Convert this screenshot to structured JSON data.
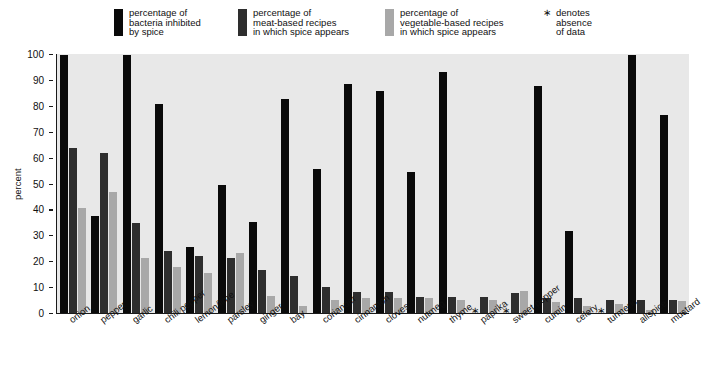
{
  "legend": {
    "items": [
      {
        "label": "percentage of\nbacteria inhibited\nby spice",
        "color": "#0a0a0a",
        "name": "legend-bacteria"
      },
      {
        "label": "percentage of\nmeat-based recipes\nin which spice appears",
        "color": "#2e2e2e",
        "name": "legend-meat"
      },
      {
        "label": "percentage of\nvegetable-based recipes\nin which spice appears",
        "color": "#a8a8a8",
        "name": "legend-vegetable"
      }
    ],
    "note": {
      "symbol": "∗",
      "text": "denotes\nabsence\nof data"
    }
  },
  "chart_data": {
    "type": "bar",
    "title": "",
    "xlabel": "",
    "ylabel": "percent",
    "ylim": [
      0,
      100
    ],
    "yticks": [
      0,
      10,
      20,
      30,
      40,
      50,
      60,
      70,
      80,
      90,
      100
    ],
    "grid": false,
    "legend_position": "top",
    "categories": [
      "onion",
      "pepper",
      "garlic",
      "chili pepper",
      "lemon/lime",
      "parsley",
      "ginger",
      "bay",
      "coriander",
      "cinnamon",
      "cloves",
      "nutmeg",
      "thyme",
      "paprika",
      "sweet pepper",
      "cumin",
      "celery",
      "turmeric",
      "allspice",
      "mustard"
    ],
    "series": [
      {
        "name": "percentage of bacteria inhibited by spice",
        "color": "#0a0a0a",
        "values": [
          100,
          38,
          100,
          81,
          26,
          50,
          35.5,
          83,
          56,
          89,
          86,
          55,
          93.5,
          null,
          null,
          88,
          32,
          null,
          100,
          77
        ]
      },
      {
        "name": "percentage of meat-based recipes in which spice appears",
        "color": "#2e2e2e",
        "values": [
          64,
          62,
          35,
          24.5,
          22.5,
          21.5,
          17,
          14.5,
          10.5,
          8.5,
          8.5,
          6.5,
          6.5,
          6.5,
          8,
          6,
          6,
          5.5,
          5.5,
          5.5
        ]
      },
      {
        "name": "percentage of vegetable-based recipes in which spice appears",
        "color": "#a8a8a8",
        "values": [
          41,
          47,
          21.5,
          18,
          16,
          23.5,
          7,
          3,
          5.5,
          6,
          6,
          6,
          5.5,
          5.5,
          9,
          4.5,
          3,
          4,
          1.5,
          5
        ]
      }
    ],
    "missing_marker": "∗",
    "missing_categories": [
      "paprika",
      "sweet pepper",
      "turmeric"
    ]
  }
}
